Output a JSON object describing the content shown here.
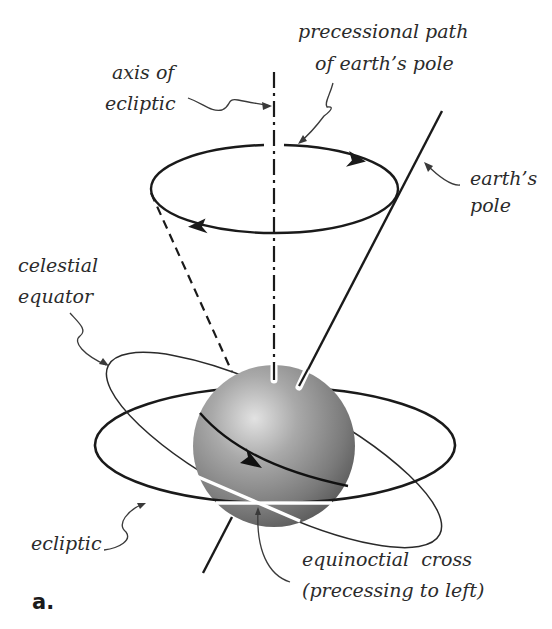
{
  "figure": {
    "panel_label": "a.",
    "colors": {
      "line": "#1a1a1a",
      "leader": "#3a3a3a",
      "sphere_light": "#d8d8d8",
      "sphere_mid": "#8e8e8e",
      "sphere_dark": "#4a4a4a",
      "background": "#ffffff"
    }
  },
  "labels": {
    "axis_of_ecliptic": {
      "line1": "axis of",
      "line2": "ecliptic"
    },
    "precessional_path": {
      "line1": "precessional path",
      "line2": "of earth’s pole"
    },
    "earths_pole": {
      "line1": "earth’s",
      "line2": "pole"
    },
    "celestial_equator": {
      "line1": "celestial",
      "line2": "equator"
    },
    "ecliptic": {
      "line1": "ecliptic"
    },
    "equinoctial_cross": {
      "line1": "equinoctial  cross",
      "line2": "(precessing to left)"
    }
  }
}
